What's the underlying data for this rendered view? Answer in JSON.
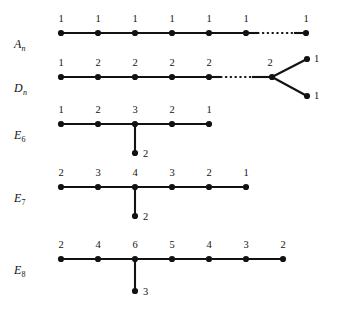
{
  "figure": {
    "title": "",
    "background": "#ffffff",
    "ink": "#121212",
    "rows": [
      {
        "id": "An",
        "label_base": "A",
        "label_sub": "n",
        "label_sub_italic": true,
        "label_x": 14,
        "label_y": 38,
        "axis_y": 33,
        "nodes": [
          {
            "name": "an-node-1",
            "x": 61,
            "y": 33,
            "label": "1",
            "lx": 61,
            "ly": 24
          },
          {
            "name": "an-node-2",
            "x": 98,
            "y": 33,
            "label": "1",
            "lx": 98,
            "ly": 24
          },
          {
            "name": "an-node-3",
            "x": 135,
            "y": 33,
            "label": "1",
            "lx": 135,
            "ly": 24
          },
          {
            "name": "an-node-4",
            "x": 172,
            "y": 33,
            "label": "1",
            "lx": 172,
            "ly": 24
          },
          {
            "name": "an-node-5",
            "x": 209,
            "y": 33,
            "label": "1",
            "lx": 209,
            "ly": 24
          },
          {
            "name": "an-node-6",
            "x": 246,
            "y": 33,
            "label": "1",
            "lx": 246,
            "ly": 24
          },
          {
            "name": "an-node-7",
            "x": 306,
            "y": 33,
            "label": "1",
            "lx": 306,
            "ly": 24
          }
        ],
        "edges": [
          {
            "name": "an-edge-1-2",
            "x1": 61,
            "y1": 33,
            "x2": 98,
            "y2": 33,
            "style": "solid"
          },
          {
            "name": "an-edge-2-3",
            "x1": 98,
            "y1": 33,
            "x2": 135,
            "y2": 33,
            "style": "solid"
          },
          {
            "name": "an-edge-3-4",
            "x1": 135,
            "y1": 33,
            "x2": 172,
            "y2": 33,
            "style": "solid"
          },
          {
            "name": "an-edge-4-5",
            "x1": 172,
            "y1": 33,
            "x2": 209,
            "y2": 33,
            "style": "solid"
          },
          {
            "name": "an-edge-5-6",
            "x1": 209,
            "y1": 33,
            "x2": 246,
            "y2": 33,
            "style": "solid"
          },
          {
            "name": "an-edge-6-stub",
            "x1": 246,
            "y1": 33,
            "x2": 258,
            "y2": 33,
            "style": "solid"
          },
          {
            "name": "an-edge-ellipsis",
            "x1": 258,
            "y1": 33,
            "x2": 294,
            "y2": 33,
            "style": "dotted"
          },
          {
            "name": "an-edge-stub-7",
            "x1": 294,
            "y1": 33,
            "x2": 306,
            "y2": 33,
            "style": "solid"
          }
        ]
      },
      {
        "id": "Dn",
        "label_base": "D",
        "label_sub": "n",
        "label_sub_italic": true,
        "label_x": 14,
        "label_y": 82,
        "axis_y": 77,
        "nodes": [
          {
            "name": "dn-node-1",
            "x": 61,
            "y": 77,
            "label": "1",
            "lx": 61,
            "ly": 68
          },
          {
            "name": "dn-node-2",
            "x": 98,
            "y": 77,
            "label": "2",
            "lx": 98,
            "ly": 68
          },
          {
            "name": "dn-node-3",
            "x": 135,
            "y": 77,
            "label": "2",
            "lx": 135,
            "ly": 68
          },
          {
            "name": "dn-node-4",
            "x": 172,
            "y": 77,
            "label": "2",
            "lx": 172,
            "ly": 68
          },
          {
            "name": "dn-node-5",
            "x": 209,
            "y": 77,
            "label": "2",
            "lx": 209,
            "ly": 68
          },
          {
            "name": "dn-node-fork",
            "x": 272,
            "y": 77,
            "label": "2",
            "lx": 270,
            "ly": 68
          },
          {
            "name": "dn-node-upper",
            "x": 307,
            "y": 59,
            "label": "1",
            "lx": 314,
            "ly": 59,
            "side": true
          },
          {
            "name": "dn-node-lower",
            "x": 307,
            "y": 96,
            "label": "1",
            "lx": 314,
            "ly": 96,
            "side": true
          }
        ],
        "edges": [
          {
            "name": "dn-edge-1-2",
            "x1": 61,
            "y1": 77,
            "x2": 98,
            "y2": 77,
            "style": "solid"
          },
          {
            "name": "dn-edge-2-3",
            "x1": 98,
            "y1": 77,
            "x2": 135,
            "y2": 77,
            "style": "solid"
          },
          {
            "name": "dn-edge-3-4",
            "x1": 135,
            "y1": 77,
            "x2": 172,
            "y2": 77,
            "style": "solid"
          },
          {
            "name": "dn-edge-4-5",
            "x1": 172,
            "y1": 77,
            "x2": 209,
            "y2": 77,
            "style": "solid"
          },
          {
            "name": "dn-edge-5-stub",
            "x1": 209,
            "y1": 77,
            "x2": 221,
            "y2": 77,
            "style": "solid"
          },
          {
            "name": "dn-edge-ellipsis",
            "x1": 221,
            "y1": 77,
            "x2": 252,
            "y2": 77,
            "style": "dotted"
          },
          {
            "name": "dn-edge-stub-fork",
            "x1": 252,
            "y1": 77,
            "x2": 272,
            "y2": 77,
            "style": "solid"
          },
          {
            "name": "dn-edge-fork-upper",
            "x1": 272,
            "y1": 77,
            "x2": 307,
            "y2": 59,
            "style": "solid"
          },
          {
            "name": "dn-edge-fork-lower",
            "x1": 272,
            "y1": 77,
            "x2": 307,
            "y2": 96,
            "style": "solid"
          }
        ]
      },
      {
        "id": "E6",
        "label_base": "E",
        "label_sub": "6",
        "label_sub_italic": false,
        "label_x": 14,
        "label_y": 129,
        "axis_y": 124,
        "nodes": [
          {
            "name": "e6-node-1",
            "x": 61,
            "y": 124,
            "label": "1",
            "lx": 61,
            "ly": 115
          },
          {
            "name": "e6-node-2",
            "x": 98,
            "y": 124,
            "label": "2",
            "lx": 98,
            "ly": 115
          },
          {
            "name": "e6-node-3",
            "x": 135,
            "y": 124,
            "label": "3",
            "lx": 135,
            "ly": 115
          },
          {
            "name": "e6-node-4",
            "x": 172,
            "y": 124,
            "label": "2",
            "lx": 172,
            "ly": 115
          },
          {
            "name": "e6-node-5",
            "x": 209,
            "y": 124,
            "label": "1",
            "lx": 209,
            "ly": 115
          },
          {
            "name": "e6-node-branch",
            "x": 135,
            "y": 153,
            "label": "2",
            "lx": 143,
            "ly": 154,
            "side": true
          }
        ],
        "edges": [
          {
            "name": "e6-edge-1-2",
            "x1": 61,
            "y1": 124,
            "x2": 98,
            "y2": 124,
            "style": "solid"
          },
          {
            "name": "e6-edge-2-3",
            "x1": 98,
            "y1": 124,
            "x2": 135,
            "y2": 124,
            "style": "solid"
          },
          {
            "name": "e6-edge-3-4",
            "x1": 135,
            "y1": 124,
            "x2": 172,
            "y2": 124,
            "style": "solid"
          },
          {
            "name": "e6-edge-4-5",
            "x1": 172,
            "y1": 124,
            "x2": 209,
            "y2": 124,
            "style": "solid"
          },
          {
            "name": "e6-edge-3-branch",
            "x1": 135,
            "y1": 124,
            "x2": 135,
            "y2": 153,
            "style": "solid"
          }
        ]
      },
      {
        "id": "E7",
        "label_base": "E",
        "label_sub": "7",
        "label_sub_italic": false,
        "label_x": 14,
        "label_y": 192,
        "axis_y": 187,
        "nodes": [
          {
            "name": "e7-node-1",
            "x": 61,
            "y": 187,
            "label": "2",
            "lx": 61,
            "ly": 178
          },
          {
            "name": "e7-node-2",
            "x": 98,
            "y": 187,
            "label": "3",
            "lx": 98,
            "ly": 178
          },
          {
            "name": "e7-node-3",
            "x": 135,
            "y": 187,
            "label": "4",
            "lx": 135,
            "ly": 178
          },
          {
            "name": "e7-node-4",
            "x": 172,
            "y": 187,
            "label": "3",
            "lx": 172,
            "ly": 178
          },
          {
            "name": "e7-node-5",
            "x": 209,
            "y": 187,
            "label": "2",
            "lx": 209,
            "ly": 178
          },
          {
            "name": "e7-node-6",
            "x": 246,
            "y": 187,
            "label": "1",
            "lx": 246,
            "ly": 178
          },
          {
            "name": "e7-node-branch",
            "x": 135,
            "y": 216,
            "label": "2",
            "lx": 143,
            "ly": 217,
            "side": true
          }
        ],
        "edges": [
          {
            "name": "e7-edge-1-2",
            "x1": 61,
            "y1": 187,
            "x2": 98,
            "y2": 187,
            "style": "solid"
          },
          {
            "name": "e7-edge-2-3",
            "x1": 98,
            "y1": 187,
            "x2": 135,
            "y2": 187,
            "style": "solid"
          },
          {
            "name": "e7-edge-3-4",
            "x1": 135,
            "y1": 187,
            "x2": 172,
            "y2": 187,
            "style": "solid"
          },
          {
            "name": "e7-edge-4-5",
            "x1": 172,
            "y1": 187,
            "x2": 209,
            "y2": 187,
            "style": "solid"
          },
          {
            "name": "e7-edge-5-6",
            "x1": 209,
            "y1": 187,
            "x2": 246,
            "y2": 187,
            "style": "solid"
          },
          {
            "name": "e7-edge-3-branch",
            "x1": 135,
            "y1": 187,
            "x2": 135,
            "y2": 216,
            "style": "solid"
          }
        ]
      },
      {
        "id": "E8",
        "label_base": "E",
        "label_sub": "8",
        "label_sub_italic": false,
        "label_x": 14,
        "label_y": 264,
        "axis_y": 259,
        "nodes": [
          {
            "name": "e8-node-1",
            "x": 61,
            "y": 259,
            "label": "2",
            "lx": 61,
            "ly": 250
          },
          {
            "name": "e8-node-2",
            "x": 98,
            "y": 259,
            "label": "4",
            "lx": 98,
            "ly": 250
          },
          {
            "name": "e8-node-3",
            "x": 135,
            "y": 259,
            "label": "6",
            "lx": 135,
            "ly": 250
          },
          {
            "name": "e8-node-4",
            "x": 172,
            "y": 259,
            "label": "5",
            "lx": 172,
            "ly": 250
          },
          {
            "name": "e8-node-5",
            "x": 209,
            "y": 259,
            "label": "4",
            "lx": 209,
            "ly": 250
          },
          {
            "name": "e8-node-6",
            "x": 246,
            "y": 259,
            "label": "3",
            "lx": 246,
            "ly": 250
          },
          {
            "name": "e8-node-7",
            "x": 283,
            "y": 259,
            "label": "2",
            "lx": 283,
            "ly": 250
          },
          {
            "name": "e8-node-branch",
            "x": 135,
            "y": 291,
            "label": "3",
            "lx": 143,
            "ly": 292,
            "side": true
          }
        ],
        "edges": [
          {
            "name": "e8-edge-1-2",
            "x1": 61,
            "y1": 259,
            "x2": 98,
            "y2": 259,
            "style": "solid"
          },
          {
            "name": "e8-edge-2-3",
            "x1": 98,
            "y1": 259,
            "x2": 135,
            "y2": 259,
            "style": "solid"
          },
          {
            "name": "e8-edge-3-4",
            "x1": 135,
            "y1": 259,
            "x2": 172,
            "y2": 259,
            "style": "solid"
          },
          {
            "name": "e8-edge-4-5",
            "x1": 172,
            "y1": 259,
            "x2": 209,
            "y2": 259,
            "style": "solid"
          },
          {
            "name": "e8-edge-5-6",
            "x1": 209,
            "y1": 259,
            "x2": 246,
            "y2": 259,
            "style": "solid"
          },
          {
            "name": "e8-edge-6-7",
            "x1": 246,
            "y1": 259,
            "x2": 283,
            "y2": 259,
            "style": "solid"
          },
          {
            "name": "e8-edge-3-branch",
            "x1": 135,
            "y1": 259,
            "x2": 135,
            "y2": 291,
            "style": "solid"
          }
        ]
      }
    ]
  },
  "chart_data": {
    "type": "diagram",
    "diagrams": [
      {
        "name": "A_n",
        "node_marks": [
          1,
          1,
          1,
          1,
          1,
          1,
          1
        ],
        "shape": "path-with-ellipsis",
        "branch_marks": []
      },
      {
        "name": "D_n",
        "node_marks": [
          1,
          2,
          2,
          2,
          2,
          2
        ],
        "shape": "path-with-ellipsis-and-fork",
        "branch_marks": [
          1,
          1
        ]
      },
      {
        "name": "E_6",
        "node_marks": [
          1,
          2,
          3,
          2,
          1
        ],
        "shape": "path-with-stem",
        "branch_marks": [
          2
        ],
        "stem_at_index": 2
      },
      {
        "name": "E_7",
        "node_marks": [
          2,
          3,
          4,
          3,
          2,
          1
        ],
        "shape": "path-with-stem",
        "branch_marks": [
          2
        ],
        "stem_at_index": 2
      },
      {
        "name": "E_8",
        "node_marks": [
          2,
          4,
          6,
          5,
          4,
          3,
          2
        ],
        "shape": "path-with-stem",
        "branch_marks": [
          3
        ],
        "stem_at_index": 2
      }
    ]
  }
}
